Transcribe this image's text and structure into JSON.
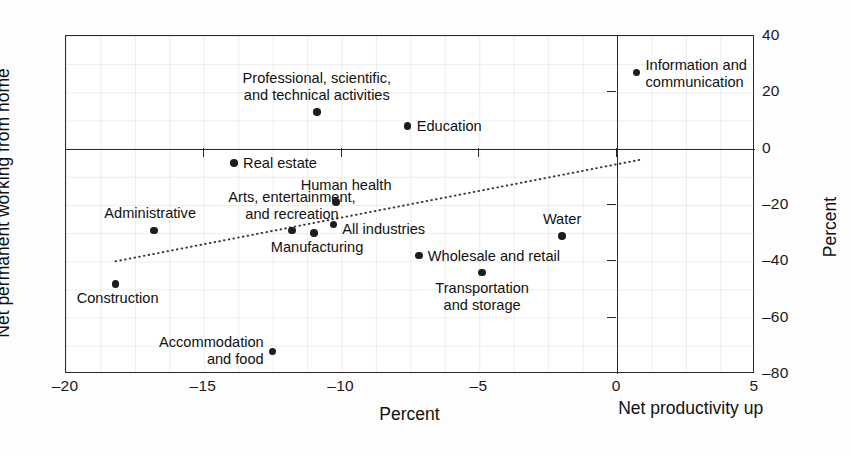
{
  "chart_data": {
    "type": "scatter",
    "title": "",
    "xlabel": "Percent",
    "ylabel": "Net permanent working from home",
    "ylabel_right": "Percent",
    "xlim": [
      -20,
      5
    ],
    "ylim": [
      -80,
      40
    ],
    "grid": true,
    "legend": "none",
    "x_ticks": [
      {
        "value": -20,
        "label": "–20"
      },
      {
        "value": -15,
        "label": "–15"
      },
      {
        "value": -10,
        "label": "–10"
      },
      {
        "value": -5,
        "label": "–5"
      },
      {
        "value": 0,
        "label": "0"
      },
      {
        "value": 5,
        "label": "5"
      }
    ],
    "y_ticks": [
      {
        "value": 40,
        "label": "40"
      },
      {
        "value": 20,
        "label": "20"
      },
      {
        "value": 0,
        "label": "0"
      },
      {
        "value": -20,
        "label": "–20"
      },
      {
        "value": -40,
        "label": "–40"
      },
      {
        "value": -60,
        "label": "–60"
      },
      {
        "value": -80,
        "label": "–80"
      }
    ],
    "x_axis_note": "Net productivity up",
    "points": [
      {
        "label": "Information and\ncommunication",
        "x": 0.7,
        "y": 27,
        "placement": "right",
        "dx": 9,
        "dy": 1
      },
      {
        "label": "Professional, scientific,\nand technical activities",
        "x": -10.9,
        "y": 13,
        "placement": "above",
        "dx": 0,
        "dy": -8
      },
      {
        "label": "Education",
        "x": -7.6,
        "y": 8,
        "placement": "right",
        "dx": 9,
        "dy": 0
      },
      {
        "label": "Real estate",
        "x": -13.9,
        "y": -5,
        "placement": "right",
        "dx": 9,
        "dy": 0
      },
      {
        "label": "Human health",
        "x": -10.2,
        "y": -19,
        "placement": "above",
        "dx": 10,
        "dy": -8
      },
      {
        "label": "Arts, entertainment,\nand recreation",
        "x": -11.8,
        "y": -29,
        "placement": "above",
        "dx": 0,
        "dy": -7
      },
      {
        "label": "All industries",
        "x": -10.3,
        "y": -27,
        "placement": "right",
        "dx": 9,
        "dy": 4
      },
      {
        "label": "Manufacturing",
        "x": -11.0,
        "y": -30,
        "placement": "below",
        "dx": 3,
        "dy": 6
      },
      {
        "label": "Administrative",
        "x": -16.8,
        "y": -29,
        "placement": "above",
        "dx": -4,
        "dy": -8
      },
      {
        "label": "Water",
        "x": -2.0,
        "y": -31,
        "placement": "above",
        "dx": 0,
        "dy": -8
      },
      {
        "label": "Wholesale and retail",
        "x": -7.2,
        "y": -38,
        "placement": "right",
        "dx": 9,
        "dy": 0
      },
      {
        "label": "Transportation\nand storage",
        "x": -4.9,
        "y": -44,
        "placement": "below",
        "dx": 0,
        "dy": 7
      },
      {
        "label": "Construction",
        "x": -18.2,
        "y": -48,
        "placement": "below",
        "dx": 2,
        "dy": 6
      },
      {
        "label": "Accommodation\nand food",
        "x": -12.5,
        "y": -72,
        "placement": "left",
        "dx": -9,
        "dy": 0
      }
    ],
    "trendline": {
      "style": "dotted",
      "x_start": -18.2,
      "y_start": -40.0,
      "x_end": 0.8,
      "y_end": -4.0
    }
  },
  "colors": {
    "point": "#1d1d1d",
    "axis": "#2b2b2b",
    "grid": "#96969f",
    "background": "#ffffff",
    "text": "#111111"
  }
}
